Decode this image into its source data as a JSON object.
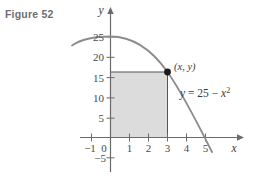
{
  "figure": {
    "caption": "Figure 52"
  },
  "chart_data": {
    "type": "line",
    "title": "Figure 52",
    "equation_label": "y = 25 − x²",
    "function": "y = 25 - x^2",
    "xlabel": "x",
    "ylabel": "y",
    "grid": false,
    "legend_position": "none",
    "xlim": [
      -1.6,
      6.0
    ],
    "ylim": [
      -7,
      28
    ],
    "x_ticks": [
      -1,
      0,
      1,
      2,
      3,
      4,
      5
    ],
    "x_tick_labels": [
      "−1",
      "0",
      "1",
      "2",
      "3",
      "4",
      "5"
    ],
    "y_ticks": [
      -5,
      0,
      5,
      10,
      15,
      20,
      25
    ],
    "y_tick_labels": [
      "−5",
      "0",
      "5",
      "10",
      "15",
      "20",
      "25"
    ],
    "curve": {
      "name": "y = 25 − x²",
      "x": [
        -1.5,
        -1.0,
        -0.5,
        0.0,
        0.5,
        1.0,
        1.5,
        2.0,
        2.5,
        3.0,
        3.5,
        4.0,
        4.5,
        5.0,
        5.3
      ],
      "y": [
        22.75,
        24.0,
        24.75,
        25.0,
        24.75,
        24.0,
        22.75,
        21.0,
        18.75,
        16.0,
        12.75,
        9.0,
        4.75,
        0.0,
        -3.09
      ],
      "color": "#8c8c8c",
      "root_positive": 5,
      "vertex": [
        0,
        25
      ]
    },
    "point": {
      "label": "(x, y)",
      "x": 3,
      "y": 16,
      "color": "#1a1a1a"
    },
    "shaded_region": {
      "label": "rectangle under point",
      "x_from": 0,
      "x_to": 3,
      "y_from": 0,
      "y_to": 16,
      "fill": "#dcdcdc"
    },
    "axis_color": "#6a6a6a",
    "annotations": [
      {
        "text": "(x, y)",
        "x": 3,
        "y": 16
      },
      {
        "text": "y = 25 − x²",
        "x": 3.9,
        "y": 12.5
      }
    ]
  }
}
